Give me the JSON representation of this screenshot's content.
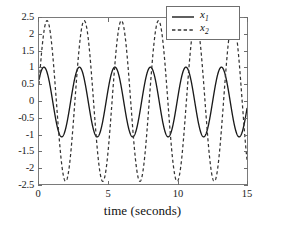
{
  "chart_data": {
    "type": "line",
    "title": "",
    "xlabel": "time (seconds)",
    "ylabel": "",
    "xlim": [
      0,
      15
    ],
    "ylim": [
      -2.5,
      2.5
    ],
    "grid": false,
    "legend_position": "upper right",
    "xticks": [
      0,
      5,
      10,
      15
    ],
    "xtick_labels": [
      "0",
      "5",
      "10",
      "15"
    ],
    "yticks": [
      2.5,
      2,
      1.5,
      1,
      0.5,
      0,
      -0.5,
      -1,
      -1.5,
      -2,
      -2.5
    ],
    "ytick_labels": [
      "2.5",
      "2",
      "1.5",
      "1",
      "0.5",
      "0",
      "-0.5",
      "-1",
      "-1.5",
      "-2",
      "-2.5"
    ],
    "series": [
      {
        "name": "x1",
        "label": "x",
        "subscript": "1",
        "linestyle": "solid",
        "color": "#1a1a1a",
        "amplitude": 1.05,
        "offset": -0.03,
        "period": 2.56,
        "phase_deg": 40,
        "peak_value": 1.05,
        "trough_value": -1.12,
        "peak_count": 6,
        "start_value": 0.68
      },
      {
        "name": "x2",
        "label": "x",
        "subscript": "2",
        "linestyle": "dashed",
        "color": "#333333",
        "amplitude": 2.42,
        "offset": 0.0,
        "period": 2.68,
        "phase_deg": 12,
        "peak_value": 2.42,
        "trough_value": -2.44,
        "peak_count": 5,
        "start_value": 0.5
      }
    ],
    "legend_entries": [
      {
        "label": "x",
        "subscript": "1",
        "linestyle": "solid"
      },
      {
        "label": "x",
        "subscript": "2",
        "linestyle": "dashed"
      }
    ]
  },
  "axes": {
    "box_color": "#7a7a7a",
    "tick_color": "#6d6d6d"
  }
}
